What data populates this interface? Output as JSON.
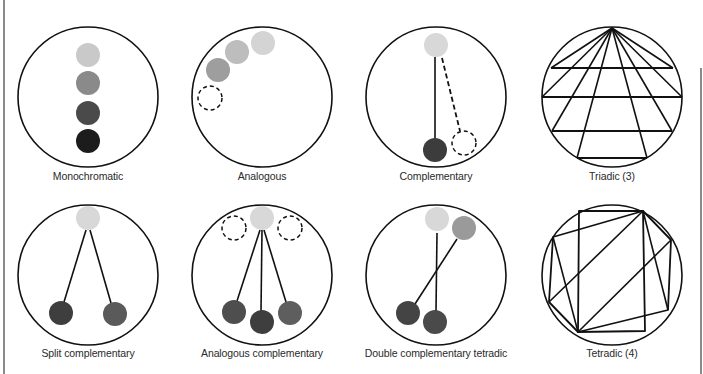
{
  "diagram": {
    "title": "",
    "colors": {
      "stroke": "#111111",
      "dot_light": "#d8d8d8",
      "dot_light_mono": "#c9c9c9",
      "dot_mid": "#9a9a9a",
      "dot_mid2": "#8a8a8a",
      "dot_midlight": "#b3b3b3",
      "dot_dark": "#4a4a4a",
      "dot_darker": "#3c3c3c",
      "dot_black": "#1c1c1c",
      "edge_bar": "#8a8a8a"
    },
    "panels": [
      {
        "id": "monochromatic",
        "label": "Monochromatic",
        "circle": {
          "cx": 88,
          "cy": 97,
          "r": 70
        },
        "label_pos": {
          "x": 88,
          "y": 172
        },
        "dots": [
          {
            "cx": 88,
            "cy": 55,
            "r": 12,
            "color": "#c9c9c9"
          },
          {
            "cx": 88,
            "cy": 83,
            "r": 12,
            "color": "#8a8a8a"
          },
          {
            "cx": 88,
            "cy": 113,
            "r": 12,
            "color": "#4a4a4a"
          },
          {
            "cx": 88,
            "cy": 141,
            "r": 12,
            "color": "#1c1c1c"
          }
        ],
        "dashed": [],
        "lines": [],
        "dashed_lines": []
      },
      {
        "id": "analogous",
        "label": "Analogous",
        "circle": {
          "cx": 262,
          "cy": 97,
          "r": 70
        },
        "label_pos": {
          "x": 262,
          "y": 172
        },
        "dots": [
          {
            "cx": 263,
            "cy": 43,
            "r": 12,
            "color": "#d4d4d4"
          },
          {
            "cx": 237,
            "cy": 52,
            "r": 12,
            "color": "#bdbdbd"
          },
          {
            "cx": 218,
            "cy": 70,
            "r": 12,
            "color": "#9e9e9e"
          }
        ],
        "dashed": [
          {
            "cx": 210,
            "cy": 98,
            "r": 12
          }
        ],
        "lines": [],
        "dashed_lines": []
      },
      {
        "id": "complementary",
        "label": "Complementary",
        "circle": {
          "cx": 436,
          "cy": 97,
          "r": 70
        },
        "label_pos": {
          "x": 436,
          "y": 172
        },
        "dots": [
          {
            "cx": 436,
            "cy": 45,
            "r": 12,
            "color": "#d8d8d8"
          },
          {
            "cx": 435,
            "cy": 150,
            "r": 12,
            "color": "#3c3c3c"
          }
        ],
        "dashed": [
          {
            "cx": 464,
            "cy": 143,
            "r": 12
          }
        ],
        "lines": [
          {
            "x1": 435,
            "y1": 57,
            "x2": 435,
            "y2": 138
          }
        ],
        "dashed_lines": [
          {
            "x1": 442,
            "y1": 58,
            "x2": 460,
            "y2": 131
          }
        ]
      },
      {
        "id": "triadic",
        "label": "Triadic (3)",
        "circle": {
          "cx": 612,
          "cy": 97,
          "r": 70
        },
        "label_pos": {
          "x": 612,
          "y": 172
        },
        "apex": {
          "x": 612,
          "y": 28
        },
        "horizontals": [
          {
            "y": 68,
            "x1": 551,
            "x2": 673
          },
          {
            "y": 97,
            "x1": 542,
            "x2": 682
          },
          {
            "y": 131,
            "x1": 552,
            "x2": 672
          },
          {
            "y": 158,
            "x1": 577,
            "x2": 647
          }
        ],
        "rays_to": [
          {
            "x": 551,
            "y": 68
          },
          {
            "x": 673,
            "y": 68
          },
          {
            "x": 542,
            "y": 97
          },
          {
            "x": 682,
            "y": 97
          },
          {
            "x": 552,
            "y": 131
          },
          {
            "x": 672,
            "y": 131
          },
          {
            "x": 577,
            "y": 158
          },
          {
            "x": 647,
            "y": 158
          }
        ]
      },
      {
        "id": "split-complementary",
        "label": "Split complementary",
        "circle": {
          "cx": 88,
          "cy": 275,
          "r": 70
        },
        "label_pos": {
          "x": 88,
          "y": 349
        },
        "dots": [
          {
            "cx": 88,
            "cy": 218,
            "r": 12,
            "color": "#d8d8d8"
          },
          {
            "cx": 61,
            "cy": 313,
            "r": 12,
            "color": "#3e3e3e"
          },
          {
            "cx": 115,
            "cy": 314,
            "r": 12,
            "color": "#5a5a5a"
          }
        ],
        "dashed": [],
        "lines": [
          {
            "x1": 86,
            "y1": 230,
            "x2": 64,
            "y2": 302
          },
          {
            "x1": 90,
            "y1": 230,
            "x2": 111,
            "y2": 303
          }
        ],
        "dashed_lines": []
      },
      {
        "id": "analogous-complementary",
        "label": "Analogous complementary",
        "circle": {
          "cx": 262,
          "cy": 275,
          "r": 70
        },
        "label_pos": {
          "x": 262,
          "y": 349
        },
        "dots": [
          {
            "cx": 262,
            "cy": 218,
            "r": 12,
            "color": "#d8d8d8"
          },
          {
            "cx": 234,
            "cy": 312,
            "r": 12,
            "color": "#4e4e4e"
          },
          {
            "cx": 262,
            "cy": 322,
            "r": 12,
            "color": "#3e3e3e"
          },
          {
            "cx": 290,
            "cy": 313,
            "r": 12,
            "color": "#5e5e5e"
          }
        ],
        "dashed": [
          {
            "cx": 234,
            "cy": 228,
            "r": 12
          },
          {
            "cx": 290,
            "cy": 228,
            "r": 12
          }
        ],
        "lines": [
          {
            "x1": 260,
            "y1": 230,
            "x2": 237,
            "y2": 301
          },
          {
            "x1": 262,
            "y1": 230,
            "x2": 261,
            "y2": 311
          },
          {
            "x1": 264,
            "y1": 230,
            "x2": 286,
            "y2": 302
          }
        ],
        "dashed_lines": []
      },
      {
        "id": "double-complementary-tetradic",
        "label": "Double complementary tetradic",
        "circle": {
          "cx": 436,
          "cy": 275,
          "r": 70
        },
        "label_pos": {
          "x": 436,
          "y": 349
        },
        "dots": [
          {
            "cx": 437,
            "cy": 219,
            "r": 12,
            "color": "#d8d8d8"
          },
          {
            "cx": 464,
            "cy": 228,
            "r": 12,
            "color": "#9a9a9a"
          },
          {
            "cx": 408,
            "cy": 313,
            "r": 12,
            "color": "#444444"
          },
          {
            "cx": 435,
            "cy": 322,
            "r": 12,
            "color": "#4a4a4a"
          }
        ],
        "dashed": [],
        "lines": [
          {
            "x1": 437,
            "y1": 233,
            "x2": 436,
            "y2": 311
          },
          {
            "x1": 457,
            "y1": 239,
            "x2": 415,
            "y2": 304
          }
        ],
        "dashed_lines": []
      },
      {
        "id": "tetradic",
        "label": "Tetradic (4)",
        "circle": {
          "cx": 612,
          "cy": 275,
          "r": 70
        },
        "label_pos": {
          "x": 612,
          "y": 349
        },
        "polygons": [
          {
            "points": "579,211 643,211 645,331 578,332",
            "name": "rectangle"
          },
          {
            "points": "553,237 643,211 671,240 668,310 578,332 549,302",
            "name": "hexagon-outline"
          }
        ],
        "extra_lines": [
          {
            "x1": 553,
            "y1": 237,
            "x2": 578,
            "y2": 332
          },
          {
            "x1": 643,
            "y1": 211,
            "x2": 668,
            "y2": 310
          },
          {
            "x1": 643,
            "y1": 211,
            "x2": 549,
            "y2": 302
          },
          {
            "x1": 671,
            "y1": 240,
            "x2": 578,
            "y2": 332
          }
        ]
      }
    ]
  }
}
